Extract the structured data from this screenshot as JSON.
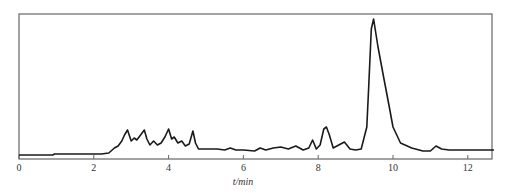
{
  "chart_data": {
    "type": "line",
    "title": "",
    "xlabel": "t/min",
    "ylabel": "",
    "xlim": [
      0,
      12.7
    ],
    "ylim": [
      0,
      144
    ],
    "xticks": [
      0,
      2,
      4,
      6,
      8,
      10,
      12
    ],
    "xtick_labels": [
      "0",
      "2",
      "4",
      "6",
      "8",
      "10",
      "12"
    ],
    "yticks": [],
    "grid": false,
    "legend": null,
    "frame": "box",
    "colors": {
      "trace": "#1a1a1a",
      "frame": "#666666",
      "text": "#333333"
    },
    "series": [
      {
        "name": "chromatogram",
        "x": [
          0.0,
          0.9,
          0.95,
          2.2,
          2.4,
          2.55,
          2.65,
          2.75,
          2.82,
          2.9,
          3.0,
          3.08,
          3.15,
          3.25,
          3.35,
          3.42,
          3.5,
          3.6,
          3.7,
          3.8,
          3.9,
          4.0,
          4.08,
          4.15,
          4.25,
          4.35,
          4.45,
          4.55,
          4.65,
          4.72,
          4.8,
          4.9,
          5.0,
          5.3,
          5.5,
          5.65,
          5.8,
          6.0,
          6.3,
          6.45,
          6.6,
          6.8,
          7.0,
          7.2,
          7.4,
          7.6,
          7.75,
          7.85,
          7.95,
          8.05,
          8.15,
          8.22,
          8.3,
          8.4,
          8.55,
          8.7,
          8.85,
          9.0,
          9.15,
          9.3,
          9.35,
          9.42,
          9.48,
          9.6,
          9.75,
          9.9,
          10.0,
          10.2,
          10.5,
          10.8,
          11.0,
          11.15,
          11.3,
          11.5,
          12.0,
          12.7
        ],
        "y": [
          2,
          2,
          3,
          3,
          4,
          9,
          11,
          16,
          22,
          27,
          16,
          19,
          17,
          22,
          27,
          18,
          12,
          16,
          12,
          14,
          20,
          28,
          18,
          20,
          14,
          16,
          11,
          13,
          26,
          14,
          8,
          8,
          8,
          8,
          7,
          9,
          7,
          7,
          6,
          9,
          7,
          9,
          10,
          8,
          11,
          7,
          9,
          17,
          8,
          12,
          28,
          30,
          22,
          9,
          12,
          15,
          8,
          7,
          8,
          30,
          70,
          128,
          138,
          110,
          80,
          50,
          30,
          14,
          9,
          6,
          6,
          11,
          8,
          7,
          7,
          7
        ]
      }
    ],
    "annotations": []
  }
}
